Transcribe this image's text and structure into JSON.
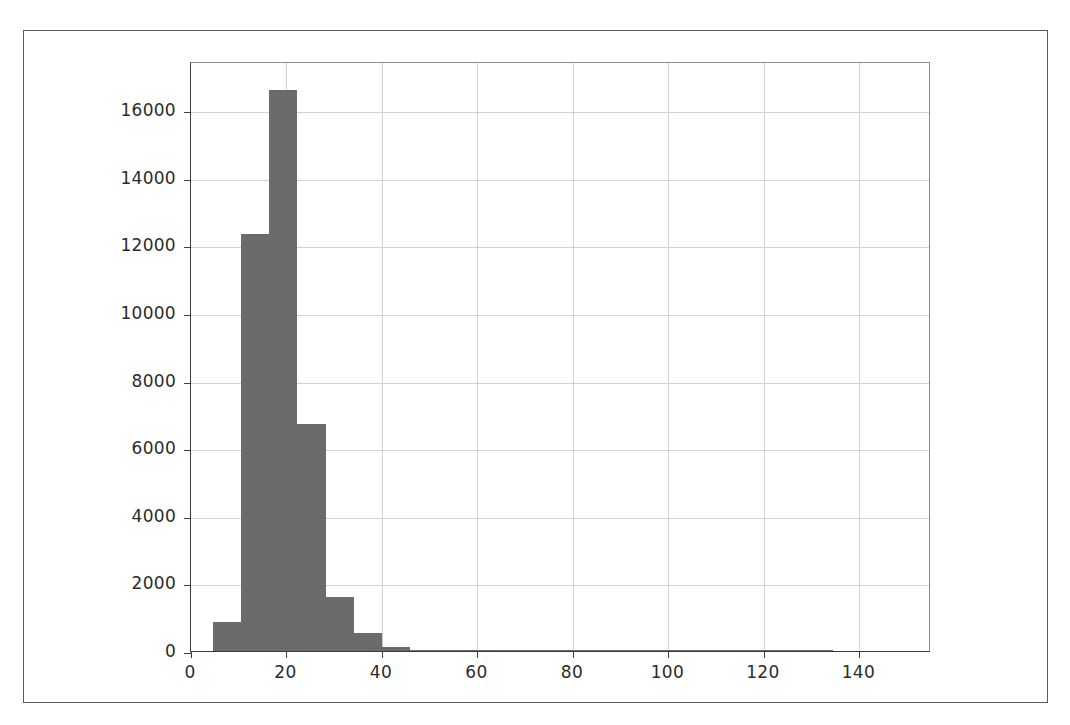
{
  "figure": {
    "background_color": "#ffffff",
    "frame_color": "#5a5a5a",
    "axes_color": "#3c3c3c",
    "grid_color": "#d2d2d2",
    "bar_color": "#6b6b6b"
  },
  "chart_data": {
    "type": "bar",
    "chart_subtype": "histogram",
    "title": "",
    "subtitle": "",
    "xlabel": "",
    "ylabel": "",
    "legend": [],
    "annotations": [],
    "grid": true,
    "legend_position": "none",
    "xlim": [
      0,
      155
    ],
    "ylim": [
      0,
      17450
    ],
    "xticks": [
      0,
      20,
      40,
      60,
      80,
      100,
      120,
      140
    ],
    "xtick_labels": [
      "0",
      "20",
      "40",
      "60",
      "80",
      "100",
      "120",
      "140"
    ],
    "yticks": [
      0,
      2000,
      4000,
      6000,
      8000,
      10000,
      12000,
      14000,
      16000
    ],
    "ytick_labels": [
      "0",
      "2000",
      "4000",
      "6000",
      "8000",
      "10000",
      "12000",
      "14000",
      "16000"
    ],
    "bin_edges": [
      4.6,
      10.5,
      16.4,
      22.3,
      28.2,
      34.1,
      40.0,
      45.9,
      51.8,
      57.7,
      63.6,
      69.5,
      75.4,
      81.3,
      87.2,
      93.1,
      99.0,
      104.9,
      110.8,
      116.7,
      122.6,
      128.5,
      134.4,
      140.3,
      146.2,
      152.1
    ],
    "values": [
      850,
      12330,
      16580,
      6700,
      1600,
      520,
      130,
      25,
      12,
      8,
      5,
      4,
      3,
      3,
      2,
      2,
      1,
      1,
      1,
      1,
      1,
      1,
      0,
      0,
      0
    ],
    "categories": [
      "4.6-10.5",
      "10.5-16.4",
      "16.4-22.3",
      "22.3-28.2",
      "28.2-34.1",
      "34.1-40.0",
      "40.0-45.9",
      "45.9-51.8",
      "51.8-57.7",
      "57.7-63.6",
      "63.6-69.5",
      "69.5-75.4",
      "75.4-81.3",
      "81.3-87.2",
      "87.2-93.1",
      "93.1-99.0",
      "99.0-104.9",
      "104.9-110.8",
      "110.8-116.7",
      "116.7-122.6",
      "122.6-128.5",
      "128.5-134.4",
      "134.4-140.3",
      "140.3-146.2",
      "146.2-152.1"
    ]
  }
}
